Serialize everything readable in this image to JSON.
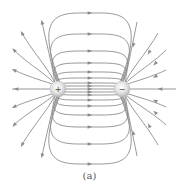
{
  "figure": {
    "caption": "(a)",
    "line_color": "#8c8c8c",
    "positive_charge": {
      "sign": "+",
      "cx": 58,
      "cy": 89,
      "r": 8
    },
    "negative_charge": {
      "sign": "−",
      "cx": 122,
      "cy": 89,
      "r": 8
    },
    "inner_loop_tops_at_center": [
      13,
      34,
      51,
      63,
      72,
      78,
      83,
      86
    ],
    "inner_loop_bottoms_at_center": [
      164,
      144,
      127,
      115,
      106,
      100,
      95,
      92
    ],
    "axis_y": 89
  }
}
